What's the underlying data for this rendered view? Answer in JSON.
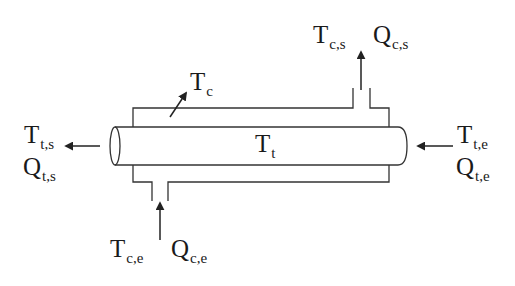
{
  "diagram": {
    "type": "double-pipe heat exchanger schematic",
    "labels": {
      "tube_outlet_temp": {
        "main": "T",
        "sub": "t,s"
      },
      "tube_outlet_flow": {
        "main": "Q",
        "sub": "t,s"
      },
      "tube_inlet_temp": {
        "main": "T",
        "sub": "t,e"
      },
      "tube_inlet_flow": {
        "main": "Q",
        "sub": "t,e"
      },
      "shell_outlet_temp": {
        "main": "T",
        "sub": "c,s"
      },
      "shell_outlet_flow": {
        "main": "Q",
        "sub": "c,s"
      },
      "shell_inlet_temp": {
        "main": "T",
        "sub": "c,e"
      },
      "shell_inlet_flow": {
        "main": "Q",
        "sub": "c,e"
      },
      "shell_temp": {
        "main": "T",
        "sub": "c"
      },
      "tube_temp": {
        "main": "T",
        "sub": "t"
      }
    },
    "colors": {
      "line": "#333333",
      "text": "#1a1a1a",
      "background": "#ffffff"
    }
  }
}
